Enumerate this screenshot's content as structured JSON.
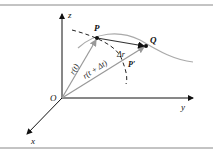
{
  "diagram": {
    "axes": {
      "x": "x",
      "y": "y",
      "z": "z"
    },
    "origin": "O",
    "points": {
      "P": "P",
      "Q": "Q",
      "P_prime": "P′"
    },
    "vectors": {
      "r_t": "r(t)",
      "r_t_dt": "r(t + Δt)",
      "delta_r": "Δr"
    },
    "colors": {
      "axis": "#111111",
      "curve": "#aaaaaa",
      "vector": "#999999",
      "secant": "#333333",
      "border": "#888888"
    }
  }
}
